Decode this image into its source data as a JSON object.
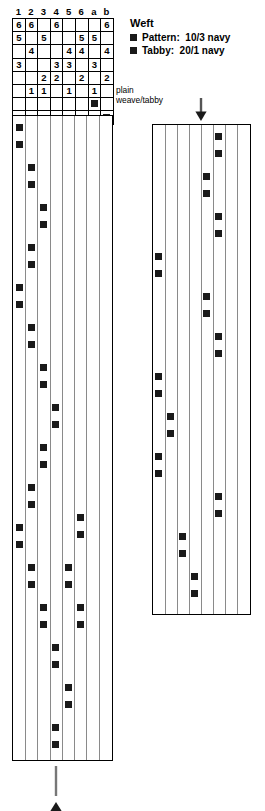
{
  "threading": {
    "column_labels": [
      "1",
      "2",
      "3",
      "4",
      "5",
      "6",
      "a",
      "b"
    ],
    "rows": [
      [
        "6",
        "6",
        "",
        "6",
        "",
        "",
        "",
        "6"
      ],
      [
        "5",
        "",
        "5",
        "",
        "",
        "5",
        "5",
        ""
      ],
      [
        "",
        "4",
        "",
        "",
        "4",
        "4",
        "",
        "4"
      ],
      [
        "3",
        "",
        "",
        "3",
        "3",
        "",
        "3",
        ""
      ],
      [
        "",
        "",
        "2",
        "2",
        "",
        "2",
        "",
        "2"
      ],
      [
        "",
        "1",
        "1",
        "",
        "1",
        "",
        "1",
        ""
      ],
      [
        "",
        "",
        "",
        "",
        "",
        "",
        "■",
        ""
      ],
      [
        "",
        "",
        "",
        "",
        "",
        "",
        "",
        "■"
      ]
    ]
  },
  "tabby_label": {
    "text": "plain\nweave/tabby"
  },
  "legend": {
    "title": "Weft",
    "items": [
      {
        "label": "Pattern:  10/3 navy",
        "color": "#1a1a1a"
      },
      {
        "label": "Tabby:  20/1 navy",
        "color": "#1a1a1a"
      }
    ]
  },
  "chart_data": {
    "type": "table",
    "title": "Weft",
    "mark_color": "#1a1a1a",
    "grid_line_color": "#8a8a8a",
    "border_color": "#000000",
    "panels": [
      {
        "name": "left-drawdown",
        "columns": 8,
        "x": 12,
        "y": 115,
        "width": 101,
        "height": 646,
        "column_width": 12.6,
        "marks": [
          {
            "col": 0,
            "y": 8
          },
          {
            "col": 0,
            "y": 25
          },
          {
            "col": 1,
            "y": 48
          },
          {
            "col": 1,
            "y": 65
          },
          {
            "col": 2,
            "y": 88
          },
          {
            "col": 2,
            "y": 105
          },
          {
            "col": 1,
            "y": 128
          },
          {
            "col": 1,
            "y": 145
          },
          {
            "col": 0,
            "y": 168
          },
          {
            "col": 0,
            "y": 185
          },
          {
            "col": 1,
            "y": 208
          },
          {
            "col": 1,
            "y": 225
          },
          {
            "col": 2,
            "y": 248
          },
          {
            "col": 2,
            "y": 265
          },
          {
            "col": 3,
            "y": 288
          },
          {
            "col": 3,
            "y": 305
          },
          {
            "col": 2,
            "y": 328
          },
          {
            "col": 2,
            "y": 345
          },
          {
            "col": 1,
            "y": 368
          },
          {
            "col": 1,
            "y": 385
          },
          {
            "col": 0,
            "y": 408
          },
          {
            "col": 0,
            "y": 425
          },
          {
            "col": 1,
            "y": 448
          },
          {
            "col": 1,
            "y": 465
          },
          {
            "col": 2,
            "y": 488
          },
          {
            "col": 2,
            "y": 505
          },
          {
            "col": 3,
            "y": 528
          },
          {
            "col": 3,
            "y": 545
          },
          {
            "col": 4,
            "y": 568
          },
          {
            "col": 4,
            "y": 585
          },
          {
            "col": 3,
            "y": 608
          },
          {
            "col": 3,
            "y": 625
          },
          {
            "col": 2,
            "y": 648
          },
          {
            "col": 2,
            "y": 665
          },
          {
            "col": 1,
            "y": 688
          },
          {
            "col": 1,
            "y": 705
          },
          {
            "col": 2,
            "y": 728
          },
          {
            "col": 2,
            "y": 745
          },
          {
            "col": 1,
            "y": 768
          },
          {
            "col": 1,
            "y": 785
          },
          {
            "col": 0,
            "y": 808
          },
          {
            "col": 0,
            "y": 825
          },
          {
            "col": 5,
            "y": 398
          },
          {
            "col": 5,
            "y": 415
          },
          {
            "col": 4,
            "y": 448
          },
          {
            "col": 4,
            "y": 465
          },
          {
            "col": 5,
            "y": 488
          },
          {
            "col": 5,
            "y": 505
          }
        ]
      },
      {
        "name": "right-drawdown",
        "columns": 8,
        "x": 152,
        "y": 124,
        "width": 99,
        "height": 491,
        "column_width": 12.3,
        "marks": [
          {
            "col": 5,
            "y": 8
          },
          {
            "col": 5,
            "y": 25
          },
          {
            "col": 4,
            "y": 48
          },
          {
            "col": 4,
            "y": 65
          },
          {
            "col": 5,
            "y": 88
          },
          {
            "col": 5,
            "y": 105
          },
          {
            "col": 0,
            "y": 128
          },
          {
            "col": 0,
            "y": 145
          },
          {
            "col": 4,
            "y": 168
          },
          {
            "col": 4,
            "y": 185
          },
          {
            "col": 5,
            "y": 208
          },
          {
            "col": 5,
            "y": 225
          },
          {
            "col": 0,
            "y": 248
          },
          {
            "col": 0,
            "y": 265
          },
          {
            "col": 1,
            "y": 288
          },
          {
            "col": 1,
            "y": 305
          },
          {
            "col": 0,
            "y": 328
          },
          {
            "col": 0,
            "y": 345
          },
          {
            "col": 5,
            "y": 368
          },
          {
            "col": 5,
            "y": 385
          },
          {
            "col": 2,
            "y": 408
          },
          {
            "col": 2,
            "y": 425
          },
          {
            "col": 3,
            "y": 448
          },
          {
            "col": 3,
            "y": 465
          }
        ]
      }
    ]
  },
  "arrows": {
    "top": {
      "name": "down-arrow",
      "direction": "down"
    },
    "bottom": {
      "name": "up-arrow",
      "direction": "up"
    }
  }
}
